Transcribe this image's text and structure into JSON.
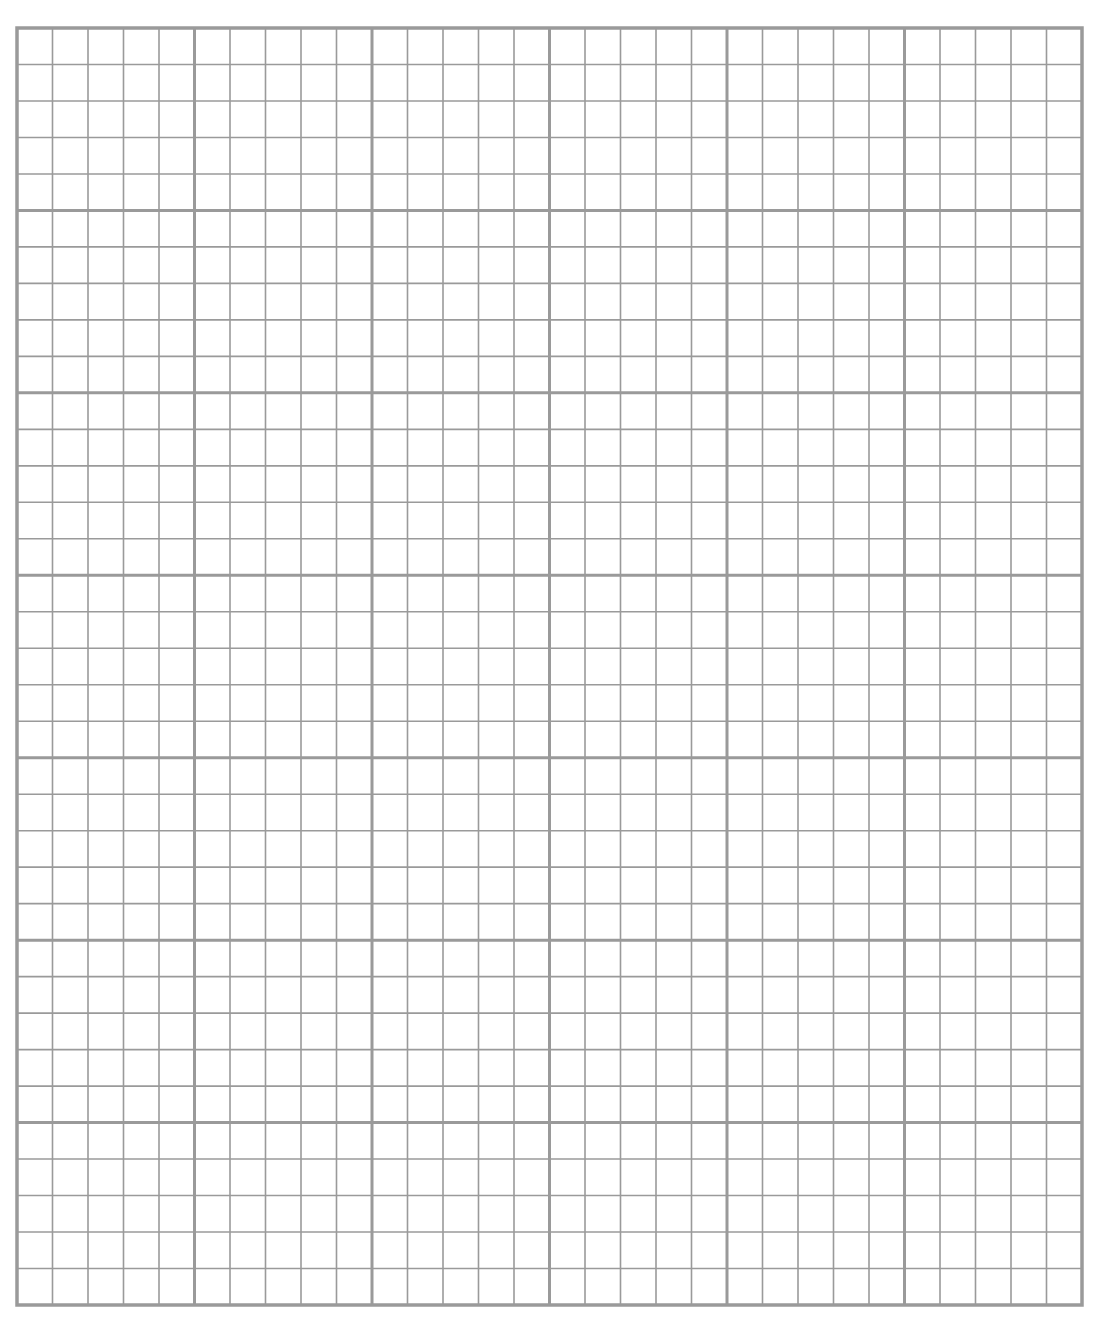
{
  "page": {
    "background": "#ffffff"
  },
  "grid": {
    "major_columns": 6,
    "major_rows": 7,
    "minor_per_major": 5,
    "line_color": "#9a9a9a",
    "major_line_width": 3,
    "minor_line_width": 1.6,
    "border_width": 3.5,
    "left": 17,
    "top": 28,
    "width": 1065,
    "height": 1277
  }
}
